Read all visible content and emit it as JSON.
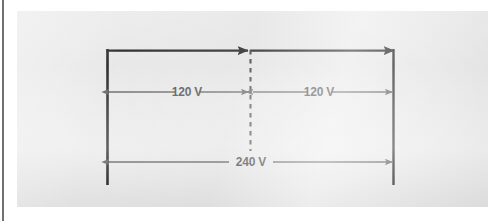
{
  "figure": {
    "panel_background": "#e9e9e9",
    "page_background": "#ffffff",
    "edge_rule_color": "#6f7072",
    "conductor_color": "#1a1a1a",
    "dimension_line_color": "#555555",
    "neutral_line_color": "#3a3a3a",
    "label_color": "#3c3c3c"
  },
  "conductors": {
    "left_leg_name": "left-hot-conductor",
    "right_leg_name": "right-hot-conductor",
    "top_bus_name": "top-supply-conductor",
    "neutral_name": "neutral-center-tap"
  },
  "dimensions": [
    {
      "id": "left-120v",
      "label": "120 V",
      "value": 120,
      "unit": "V",
      "from": "left-hot-conductor",
      "to": "neutral-center-tap"
    },
    {
      "id": "right-120v",
      "label": "120 V",
      "value": 120,
      "unit": "V",
      "from": "neutral-center-tap",
      "to": "right-hot-conductor"
    },
    {
      "id": "total-240v",
      "label": "240 V",
      "value": 240,
      "unit": "V",
      "from": "left-hot-conductor",
      "to": "right-hot-conductor"
    }
  ]
}
